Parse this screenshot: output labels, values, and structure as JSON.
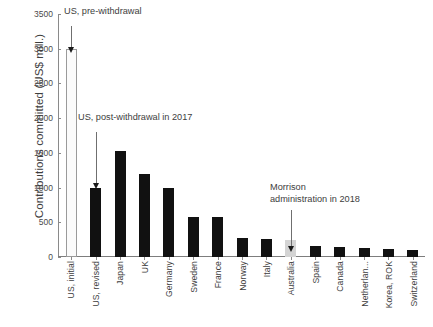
{
  "chart_data": {
    "type": "bar",
    "title": "",
    "xlabel": "",
    "ylabel": "Contributions committed (US$ mill.)",
    "ylim": [
      0,
      3500
    ],
    "ytick_step": 500,
    "yticks": [
      "3500",
      "3000",
      "2500",
      "2000",
      "1500",
      "1000",
      "500",
      "0"
    ],
    "grid": false,
    "legend": "none",
    "categories": [
      "US, initial",
      "US, revised",
      "Japan",
      "UK",
      "Germany",
      "Sweden",
      "France",
      "Norway",
      "Italy",
      "Australia",
      "Spain",
      "Canada",
      "Netherlan...",
      "Korea, ROK",
      "Switzerland"
    ],
    "values": [
      3000,
      1000,
      1520,
      1200,
      1000,
      580,
      570,
      270,
      265,
      250,
      165,
      145,
      130,
      110,
      105
    ],
    "bar_styles": [
      "light",
      "dark",
      "dark",
      "dark",
      "dark",
      "dark",
      "dark",
      "dark",
      "dark",
      "highlight",
      "dark",
      "dark",
      "dark",
      "dark",
      "dark"
    ],
    "annotations": [
      {
        "text": "US, pre-withdrawal",
        "target": "US, initial",
        "target_value": 3000
      },
      {
        "text": "US, post-withdrawal in 2017",
        "target": "US, revised",
        "target_value": 1000
      },
      {
        "text": "Morrison\nadministration in 2018",
        "target": "Australia",
        "target_value": 250
      }
    ],
    "colors": {
      "dark_bar": "#111111",
      "light_bar": "#fbfbfb",
      "light_bar_border": "#9a9a9a",
      "highlight_bar": "#d4d4d4",
      "axis": "#8a8a8a",
      "text": "#3d3d3d",
      "background": "#ffffff"
    }
  }
}
